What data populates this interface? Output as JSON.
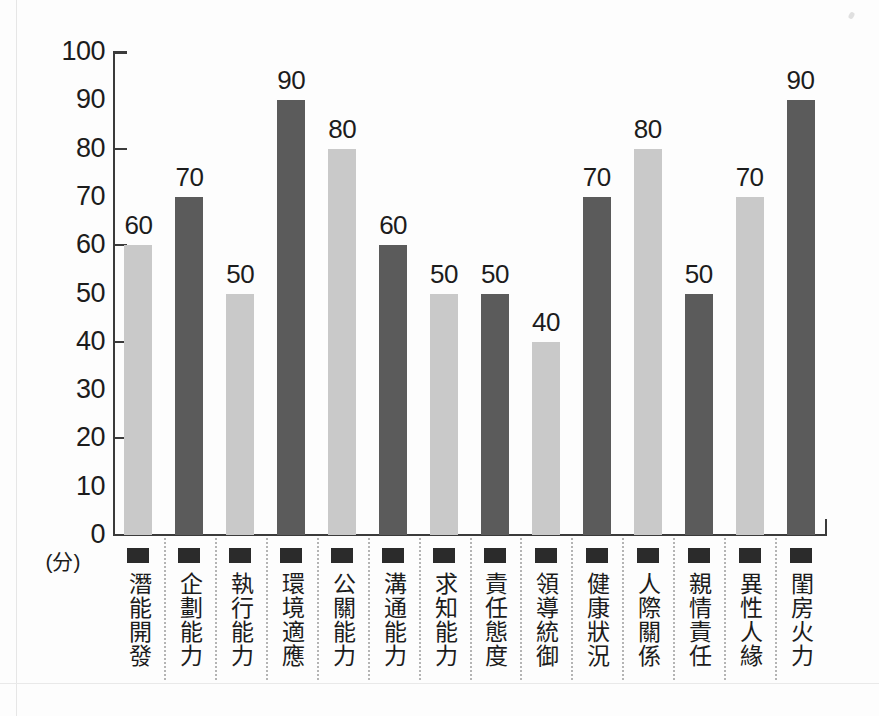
{
  "chart_data": {
    "type": "bar",
    "title": "",
    "subtitle": "",
    "xlabel": "",
    "ylabel": "(分)",
    "ylim": [
      0,
      100
    ],
    "ytick_labels": [
      "100",
      "90",
      "80",
      "70",
      "60",
      "50",
      "40",
      "30",
      "20",
      "10",
      "0"
    ],
    "ytick_values": [
      100,
      90,
      80,
      70,
      60,
      50,
      40,
      30,
      20,
      10,
      0
    ],
    "major_ticks": [
      100,
      80,
      60,
      40,
      20,
      0
    ],
    "grid": false,
    "legend": "none",
    "categories": [
      "潛能開發",
      "企劃能力",
      "執行能力",
      "環境適應",
      "公關能力",
      "溝通能力",
      "求知能力",
      "責任態度",
      "領導統御",
      "健康狀況",
      "人際關係",
      "親情責任",
      "異性人緣",
      "閨房火力"
    ],
    "values": [
      60,
      70,
      50,
      90,
      80,
      60,
      50,
      50,
      40,
      70,
      80,
      50,
      70,
      90
    ],
    "value_labels": [
      "60",
      "70",
      "50",
      "90",
      "80",
      "60",
      "50",
      "50",
      "40",
      "70",
      "80",
      "50",
      "70",
      "90"
    ],
    "bar_colors": [
      "#c9c9c9",
      "#5b5b5b",
      "#c9c9c9",
      "#5b5b5b",
      "#c9c9c9",
      "#5b5b5b",
      "#c9c9c9",
      "#5b5b5b",
      "#c9c9c9",
      "#5b5b5b",
      "#c9c9c9",
      "#5b5b5b",
      "#c9c9c9",
      "#5b5b5b"
    ],
    "colors": {
      "light_bar": "#c9c9c9",
      "dark_bar": "#5b5b5b",
      "axis": "#3b3b3b",
      "text": "#1c1c1c",
      "separator": "#b4b4b4",
      "bullet": "#2b2b2b",
      "background": "#fdfdfd"
    }
  }
}
